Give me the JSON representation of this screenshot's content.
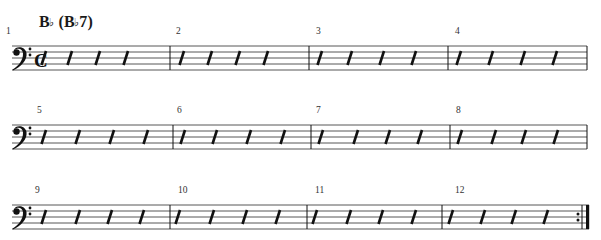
{
  "chord_symbol": {
    "root": "B",
    "root_accidental": "♭",
    "open_paren": "(",
    "alt_root": "B",
    "alt_accidental": "♭",
    "alt_quality": "7",
    "close_paren": ")"
  },
  "clef": {
    "icon": "bass-clef-icon",
    "glyph": "𝄢"
  },
  "time_signature": {
    "icon": "common-time-icon",
    "glyph": "c"
  },
  "colors": {
    "ink": "#111111",
    "staff": "#444444",
    "background": "#ffffff"
  },
  "systems": [
    {
      "staff_top": 46,
      "has_time_signature": true,
      "barlines": [
        170,
        309,
        448,
        587
      ],
      "measures": [
        {
          "number": "1",
          "num_x": 6,
          "slashes": [
            42,
            68,
            96,
            124
          ]
        },
        {
          "number": "2",
          "num_x": 176,
          "slashes": [
            180,
            208,
            236,
            264
          ]
        },
        {
          "number": "3",
          "num_x": 316,
          "slashes": [
            318,
            348,
            380,
            412
          ]
        },
        {
          "number": "4",
          "num_x": 455,
          "slashes": [
            457,
            489,
            521,
            553
          ]
        }
      ]
    },
    {
      "staff_top": 125,
      "has_time_signature": false,
      "barlines": [
        173,
        311,
        450,
        587
      ],
      "measures": [
        {
          "number": "5",
          "num_x": 37,
          "slashes": [
            42,
            76,
            110,
            144
          ]
        },
        {
          "number": "6",
          "num_x": 177,
          "slashes": [
            181,
            213,
            247,
            281
          ]
        },
        {
          "number": "7",
          "num_x": 316,
          "slashes": [
            319,
            354,
            386,
            418
          ]
        },
        {
          "number": "8",
          "num_x": 456,
          "slashes": [
            458,
            492,
            522,
            554
          ]
        }
      ]
    },
    {
      "staff_top": 205,
      "has_time_signature": false,
      "barlines": [
        170,
        307,
        442
      ],
      "final_repeat_barline": {
        "dots_x": 578,
        "thin_x": 582,
        "thick_x": 586
      },
      "measures": [
        {
          "number": "9",
          "num_x": 35,
          "slashes": [
            42,
            76,
            108,
            140
          ]
        },
        {
          "number": "10",
          "num_x": 178,
          "slashes": [
            176,
            210,
            243,
            276
          ]
        },
        {
          "number": "11",
          "num_x": 315,
          "slashes": [
            313,
            347,
            379,
            412
          ]
        },
        {
          "number": "12",
          "num_x": 455,
          "slashes": [
            449,
            481,
            512,
            544
          ]
        }
      ]
    }
  ]
}
